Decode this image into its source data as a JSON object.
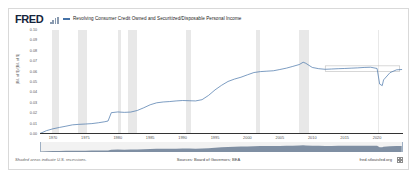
{
  "header": {
    "logo_text": "FRED",
    "logo_mark": "bar-chart-mark",
    "legend_label": "Revolving Consumer Credit Owned and Securitized/Disposable Personal Income",
    "legend_color": "#4572a7"
  },
  "footer": {
    "recession_note": "Shaded areas indicate U.S. recessions.",
    "source_note": "Sources: Board of Governors; BEA",
    "url": "fred.stlouisfed.org",
    "expand_icon": "expand-corners-icon"
  },
  "colors": {
    "line": "#4572a7",
    "recession_band": "#e8e8e8",
    "axis": "#333333",
    "navigator_fill": "#7f8fa3",
    "card_border": "#d9d9d9"
  },
  "chart_data": {
    "type": "line",
    "title": "Revolving Consumer Credit Owned and Securitized/Disposable Personal Income",
    "xlabel": "",
    "ylabel": "(Bil. of $)/(Bil. of $)",
    "xlim": [
      1968,
      2024
    ],
    "ylim": [
      0.0,
      0.1
    ],
    "grid": false,
    "legend_position": "top",
    "xticks": [
      "1970",
      "1975",
      "1980",
      "1985",
      "1990",
      "1995",
      "2000",
      "2005",
      "2010",
      "2015",
      "2020"
    ],
    "xtick_values": [
      1970,
      1975,
      1980,
      1985,
      1990,
      1995,
      2000,
      2005,
      2010,
      2015,
      2020
    ],
    "yticks": [
      "0.00",
      "0.01",
      "0.02",
      "0.03",
      "0.04",
      "0.05",
      "0.06",
      "0.07",
      "0.08",
      "0.09",
      "0.10"
    ],
    "ytick_values": [
      0.0,
      0.01,
      0.02,
      0.03,
      0.04,
      0.05,
      0.06,
      0.07,
      0.08,
      0.09,
      0.1
    ],
    "recessions": [
      {
        "start": 1969.92,
        "end": 1970.92
      },
      {
        "start": 1973.92,
        "end": 1975.25
      },
      {
        "start": 1980.0,
        "end": 1980.5
      },
      {
        "start": 1981.5,
        "end": 1982.92
      },
      {
        "start": 1990.5,
        "end": 1991.25
      },
      {
        "start": 2001.25,
        "end": 2001.92
      },
      {
        "start": 2007.92,
        "end": 2009.5
      },
      {
        "start": 2020.08,
        "end": 2020.33
      }
    ],
    "annotation_box": {
      "x0": 2012.0,
      "x1": 2023.5,
      "y0": 0.06,
      "y1": 0.0655
    },
    "series": [
      {
        "name": "Revolving Consumer Credit Owned and Securitized/Disposable Personal Income",
        "color": "#4572a7",
        "x": [
          1968.0,
          1969.0,
          1970.0,
          1971.0,
          1972.0,
          1973.0,
          1974.0,
          1975.0,
          1976.0,
          1977.0,
          1978.0,
          1978.5,
          1979.0,
          1980.0,
          1981.0,
          1982.0,
          1983.0,
          1984.0,
          1985.0,
          1986.0,
          1987.0,
          1988.0,
          1989.0,
          1990.0,
          1991.0,
          1992.0,
          1993.0,
          1994.0,
          1995.0,
          1996.0,
          1997.0,
          1998.0,
          1999.0,
          2000.0,
          2001.0,
          2002.0,
          2003.0,
          2004.0,
          2005.0,
          2006.0,
          2007.0,
          2008.0,
          2008.6,
          2009.0,
          2010.0,
          2011.0,
          2012.0,
          2013.0,
          2014.0,
          2015.0,
          2016.0,
          2017.0,
          2018.0,
          2019.0,
          2020.0,
          2020.4,
          2020.8,
          2021.0,
          2022.0,
          2023.0,
          2023.8
        ],
        "y": [
          0.0005,
          0.0032,
          0.005,
          0.0063,
          0.0075,
          0.0088,
          0.0093,
          0.0096,
          0.01,
          0.0108,
          0.0118,
          0.0125,
          0.0205,
          0.0212,
          0.0208,
          0.0211,
          0.0226,
          0.0252,
          0.0281,
          0.03,
          0.0308,
          0.0312,
          0.0318,
          0.0322,
          0.032,
          0.0318,
          0.033,
          0.0371,
          0.0424,
          0.0468,
          0.0505,
          0.0528,
          0.0546,
          0.0569,
          0.0591,
          0.06,
          0.0604,
          0.0608,
          0.062,
          0.0633,
          0.065,
          0.0668,
          0.069,
          0.068,
          0.064,
          0.0628,
          0.0622,
          0.0625,
          0.0628,
          0.063,
          0.0633,
          0.0636,
          0.064,
          0.0642,
          0.063,
          0.048,
          0.0465,
          0.052,
          0.059,
          0.0617,
          0.062
        ]
      }
    ]
  }
}
